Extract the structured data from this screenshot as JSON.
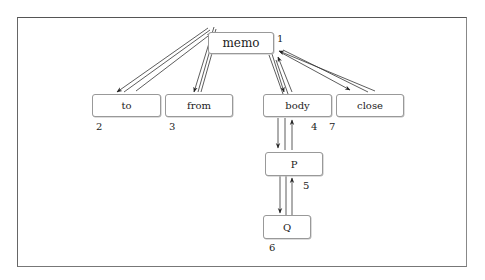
{
  "diagram": {
    "type": "tree",
    "nodes": [
      {
        "id": "memo",
        "label": "memo",
        "order": "1"
      },
      {
        "id": "to",
        "label": "to",
        "order": "2"
      },
      {
        "id": "from",
        "label": "from",
        "order": "3"
      },
      {
        "id": "body",
        "label": "body",
        "order": "4"
      },
      {
        "id": "P",
        "label": "P",
        "order": "5"
      },
      {
        "id": "Q",
        "label": "Q",
        "order": "6"
      },
      {
        "id": "close",
        "label": "close",
        "order": "7"
      }
    ],
    "edges": [
      {
        "from": "memo",
        "to": "to",
        "bidirectional": true
      },
      {
        "from": "memo",
        "to": "from",
        "bidirectional": true
      },
      {
        "from": "memo",
        "to": "body",
        "bidirectional": true
      },
      {
        "from": "memo",
        "to": "close",
        "bidirectional": true
      },
      {
        "from": "body",
        "to": "P",
        "bidirectional": true
      },
      {
        "from": "P",
        "to": "Q",
        "bidirectional": true
      }
    ]
  },
  "colors": {
    "frame": "#666666",
    "node_border": "#999999",
    "edge": "#222222",
    "text": "#222222"
  }
}
